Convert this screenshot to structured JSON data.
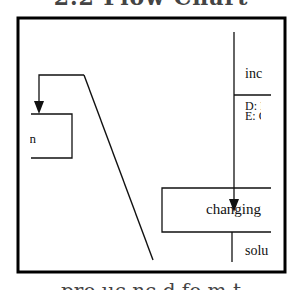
{
  "figure": {
    "top_title_fragment": "2.2 Flow Chart",
    "bottom_caption_fragment": "pro  uc  nc  d  fo  m  t",
    "colors": {
      "ink": "#111111",
      "frame": "#000000",
      "background": "#ffffff"
    }
  },
  "diagram": {
    "right_column": {
      "label_top": "inc",
      "label_d": "D: I",
      "label_e": "E: C"
    },
    "main_box": {
      "label": "changing"
    },
    "below_box": {
      "label": "solu"
    },
    "left_box": {
      "label": "n"
    }
  }
}
